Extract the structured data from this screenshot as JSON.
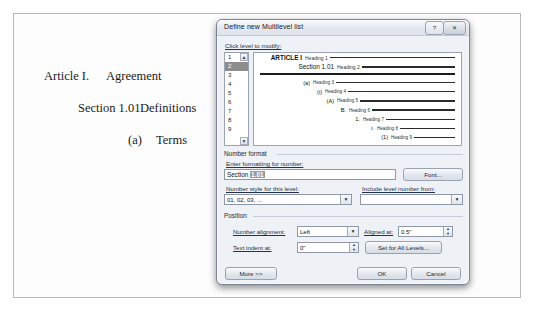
{
  "document": {
    "lines": [
      {
        "number": "Article I.",
        "text": "Agreement",
        "level": 1
      },
      {
        "number": "Section 1.01",
        "text": "Definitions",
        "level": 2
      },
      {
        "number": "(a)",
        "text": "Terms",
        "level": 3
      }
    ]
  },
  "dialog": {
    "title": "Define new Multilevel list",
    "help_label": "?",
    "close_label": "✕",
    "click_level_label": "Click level to modify:",
    "levels": [
      "1",
      "2",
      "3",
      "4",
      "5",
      "6",
      "7",
      "8",
      "9"
    ],
    "selected_level": "2",
    "scroll_up": "▲",
    "scroll_down": "▼",
    "preview": [
      {
        "number": "ARTICLE I",
        "text": "Heading 1",
        "indent": 4,
        "numwidth": 44,
        "style": "h1"
      },
      {
        "number": "Section 1.01",
        "text": "Heading 2",
        "indent": 4,
        "numwidth": 76,
        "style": "h2"
      },
      {
        "number": "(a)",
        "text": "Heading 3",
        "indent": 30,
        "numwidth": 26,
        "style": ""
      },
      {
        "number": "(i)",
        "text": "Heading 4",
        "indent": 44,
        "numwidth": 24,
        "style": ""
      },
      {
        "number": "(A)",
        "text": "Heading 5",
        "indent": 56,
        "numwidth": 24,
        "style": ""
      },
      {
        "number": "B.",
        "text": "Heading 6",
        "indent": 70,
        "numwidth": 22,
        "style": ""
      },
      {
        "number": "1.",
        "text": "Heading 7",
        "indent": 84,
        "numwidth": 22,
        "style": ""
      },
      {
        "number": "i.",
        "text": "Heading 8",
        "indent": 100,
        "numwidth": 20,
        "style": ""
      },
      {
        "number": "(1)",
        "text": "Heading 9",
        "indent": 112,
        "numwidth": 22,
        "style": ""
      }
    ],
    "number_format": {
      "group_label": "Number format",
      "enter_formatting_label": "Enter formatting for number:",
      "value_prefix": "Section ",
      "value_selected": "1.01",
      "font_button": "Font...",
      "number_style_label": "Number style for this level:",
      "number_style_value": "01, 02, 03, ...",
      "include_level_label": "Include level number from:",
      "include_level_value": ""
    },
    "position": {
      "group_label": "Position",
      "number_alignment_label": "Number alignment:",
      "number_alignment_value": "Left",
      "aligned_at_label": "Aligned at:",
      "aligned_at_value": "0.5\"",
      "text_indent_label": "Text indent at:",
      "text_indent_value": "0\"",
      "set_all_levels_button": "Set for All Levels..."
    },
    "footer": {
      "more_button": "More >>",
      "ok_button": "OK",
      "cancel_button": "Cancel"
    }
  },
  "colors": {
    "dialog_face": "#eef1f5",
    "dialog_border": "#7b8594",
    "selection": "#8d8d8d",
    "rule": "#2b2b2b"
  }
}
